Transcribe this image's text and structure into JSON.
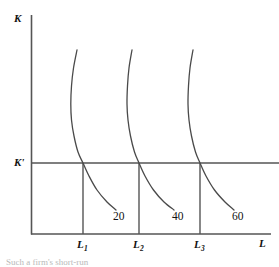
{
  "figure": {
    "axes": {
      "y_label": "K",
      "x_label": "L",
      "k_star_label": "K'"
    },
    "x_ticks": [
      {
        "label": "L",
        "sub": "1"
      },
      {
        "label": "L",
        "sub": "2"
      },
      {
        "label": "L",
        "sub": "3"
      }
    ],
    "isoquant_labels": [
      "20",
      "40",
      "60"
    ],
    "caption": "Such a firm's short-run",
    "colors": {
      "line": "#555555",
      "curve": "#4a4a4a",
      "text": "#111111",
      "background": "#ffffff"
    }
  },
  "chart_data": {
    "type": "line",
    "title": "",
    "xlabel": "L",
    "ylabel": "K",
    "grid": false,
    "legend": "none",
    "xlim": [
      0,
      279
    ],
    "ylim": [
      0,
      267
    ],
    "fixed_capital_line": {
      "label": "K'",
      "y_pixel": 163
    },
    "series": [
      {
        "name": "20",
        "label": "20",
        "intersection_tick": "L1",
        "points": [
          [
            77,
            50
          ],
          [
            73.5,
            68
          ],
          [
            71.5,
            86
          ],
          [
            70.8,
            104
          ],
          [
            71.5,
            120
          ],
          [
            74,
            136
          ],
          [
            78,
            152
          ],
          [
            83,
            163
          ],
          [
            89,
            176
          ],
          [
            97,
            190
          ],
          [
            107,
            202
          ],
          [
            116,
            210
          ]
        ],
        "label_pos": [
          120,
          217
        ]
      },
      {
        "name": "40",
        "label": "40",
        "intersection_tick": "L2",
        "points": [
          [
            132,
            50
          ],
          [
            129,
            68
          ],
          [
            127.5,
            86
          ],
          [
            127,
            104
          ],
          [
            128,
            120
          ],
          [
            130.5,
            136
          ],
          [
            134.5,
            152
          ],
          [
            139,
            163
          ],
          [
            145,
            176
          ],
          [
            153.5,
            190
          ],
          [
            164,
            202
          ],
          [
            174,
            210
          ]
        ],
        "label_pos": [
          179,
          217
        ]
      },
      {
        "name": "60",
        "label": "60",
        "intersection_tick": "L3",
        "points": [
          [
            193,
            50
          ],
          [
            190,
            68
          ],
          [
            188.5,
            86
          ],
          [
            188,
            104
          ],
          [
            189,
            120
          ],
          [
            191.5,
            136
          ],
          [
            195.5,
            152
          ],
          [
            200,
            163
          ],
          [
            206,
            176
          ],
          [
            214.5,
            190
          ],
          [
            225,
            202
          ],
          [
            234,
            210
          ]
        ],
        "label_pos": [
          239,
          217
        ]
      }
    ],
    "drop_lines": [
      {
        "tick": "L1",
        "x_pixel": 83,
        "from_y": 163,
        "to_y": 234
      },
      {
        "tick": "L2",
        "x_pixel": 139,
        "from_y": 163,
        "to_y": 234
      },
      {
        "tick": "L3",
        "x_pixel": 200,
        "from_y": 163,
        "to_y": 234
      }
    ]
  }
}
